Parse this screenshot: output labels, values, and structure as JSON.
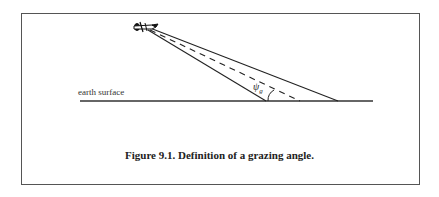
{
  "figure": {
    "caption": "Figure 9.1. Definition of a grazing angle.",
    "labels": {
      "surface": "earth surface",
      "angle_symbol": "ψ",
      "angle_subscript": "g"
    },
    "elements": {
      "aircraft": "aircraft-icon",
      "beam": "radar-beam",
      "boresight": "dashed-centerline",
      "ground": "earth-surface-line",
      "angle_arc": "grazing-angle-arc"
    }
  }
}
